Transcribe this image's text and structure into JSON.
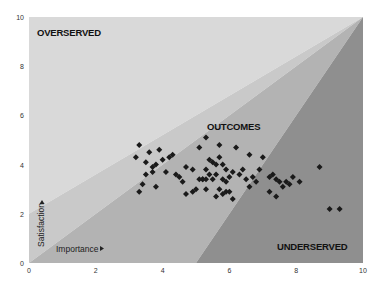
{
  "chart_data": {
    "type": "scatter",
    "title": "",
    "xlabel": "Importance",
    "ylabel": "Satisfaction",
    "xlim": [
      0,
      10
    ],
    "ylim": [
      0,
      10
    ],
    "x_ticks": [
      "0",
      "2",
      "4",
      "6",
      "8",
      "10"
    ],
    "y_ticks": [
      "0",
      "2",
      "4",
      "6",
      "8",
      "10"
    ],
    "grid": false,
    "legend": null,
    "zones": [
      {
        "name": "OVERSERVED",
        "polygon": [
          [
            0,
            2
          ],
          [
            10,
            10
          ],
          [
            0,
            10
          ]
        ],
        "color": "#d9d9d9"
      },
      {
        "name": "OUTCOMES upper band",
        "polygon": [
          [
            0,
            0
          ],
          [
            10,
            10
          ],
          [
            0,
            2
          ]
        ],
        "color": "#c9c9c9"
      },
      {
        "name": "OUTCOMES lower band",
        "polygon": [
          [
            0,
            0
          ],
          [
            5,
            0
          ],
          [
            10,
            10
          ]
        ],
        "color": "#b3b3b3"
      },
      {
        "name": "UNDERSERVED",
        "polygon": [
          [
            5,
            0
          ],
          [
            10,
            0
          ],
          [
            10,
            10
          ]
        ],
        "color": "#8f8f8f"
      }
    ],
    "annotations": [
      {
        "text": "OVERSERVED",
        "x": 0.3,
        "y": 9.5
      },
      {
        "text": "OUTCOMES",
        "x": 5.3,
        "y": 5.4
      },
      {
        "text": "UNDERSERVED",
        "x": 7.4,
        "y": 0.5
      }
    ],
    "series": [
      {
        "name": "Outcomes",
        "marker": "diamond",
        "color": "#1a1a1a",
        "points": [
          [
            3.3,
            4.8
          ],
          [
            3.2,
            4.3
          ],
          [
            3.6,
            4.5
          ],
          [
            3.9,
            4.6
          ],
          [
            3.5,
            4.1
          ],
          [
            3.7,
            3.9
          ],
          [
            3.8,
            4.0
          ],
          [
            4.0,
            4.2
          ],
          [
            4.2,
            4.3
          ],
          [
            4.3,
            4.4
          ],
          [
            4.1,
            3.7
          ],
          [
            3.7,
            3.7
          ],
          [
            3.5,
            3.6
          ],
          [
            3.4,
            3.2
          ],
          [
            3.3,
            2.9
          ],
          [
            3.8,
            3.1
          ],
          [
            4.6,
            3.3
          ],
          [
            4.5,
            3.5
          ],
          [
            4.9,
            3.8
          ],
          [
            4.7,
            3.9
          ],
          [
            4.4,
            3.6
          ],
          [
            4.9,
            2.9
          ],
          [
            5.2,
            3.4
          ],
          [
            5.3,
            3.0
          ],
          [
            5.3,
            5.1
          ],
          [
            5.1,
            4.7
          ],
          [
            5.7,
            4.8
          ],
          [
            5.4,
            4.2
          ],
          [
            5.5,
            4.1
          ],
          [
            5.3,
            3.8
          ],
          [
            5.6,
            4.0
          ],
          [
            5.7,
            4.3
          ],
          [
            5.8,
            4.0
          ],
          [
            5.9,
            3.8
          ],
          [
            5.6,
            3.6
          ],
          [
            5.8,
            3.4
          ],
          [
            5.9,
            3.3
          ],
          [
            5.4,
            3.6
          ],
          [
            5.1,
            3.4
          ],
          [
            5.2,
            3.4
          ],
          [
            5.3,
            3.4
          ],
          [
            5.5,
            3.4
          ],
          [
            5.7,
            3.0
          ],
          [
            5.8,
            2.8
          ],
          [
            5.9,
            2.9
          ],
          [
            5.6,
            2.7
          ],
          [
            6.0,
            2.9
          ],
          [
            6.1,
            2.6
          ],
          [
            6.3,
            3.6
          ],
          [
            6.5,
            3.4
          ],
          [
            6.6,
            3.1
          ],
          [
            6.8,
            3.3
          ],
          [
            6.7,
            3.5
          ],
          [
            6.4,
            3.8
          ],
          [
            6.2,
            4.7
          ],
          [
            6.9,
            3.8
          ],
          [
            7.0,
            4.3
          ],
          [
            7.2,
            3.5
          ],
          [
            7.4,
            3.4
          ],
          [
            7.5,
            3.3
          ],
          [
            7.2,
            2.9
          ],
          [
            7.4,
            2.7
          ],
          [
            7.7,
            3.3
          ],
          [
            7.3,
            3.6
          ],
          [
            7.6,
            3.1
          ],
          [
            7.8,
            3.2
          ],
          [
            7.9,
            3.5
          ],
          [
            8.1,
            3.3
          ],
          [
            8.7,
            3.9
          ],
          [
            9.0,
            2.2
          ],
          [
            9.3,
            2.2
          ],
          [
            6.6,
            4.4
          ],
          [
            6.0,
            3.5
          ],
          [
            6.1,
            3.7
          ],
          [
            5.0,
            3.0
          ],
          [
            4.7,
            2.8
          ]
        ]
      }
    ],
    "zone_boundaries": [
      {
        "from": [
          0,
          2
        ],
        "to": [
          10,
          10
        ]
      },
      {
        "from": [
          0,
          0
        ],
        "to": [
          10,
          10
        ]
      },
      {
        "from": [
          5,
          0
        ],
        "to": [
          10,
          10
        ]
      }
    ]
  },
  "labels": {
    "overserved": "OVERSERVED",
    "outcomes": "OUTCOMES",
    "underserved": "UNDERSERVED",
    "x_axis": "Importance",
    "y_axis": "Satisfaction"
  }
}
